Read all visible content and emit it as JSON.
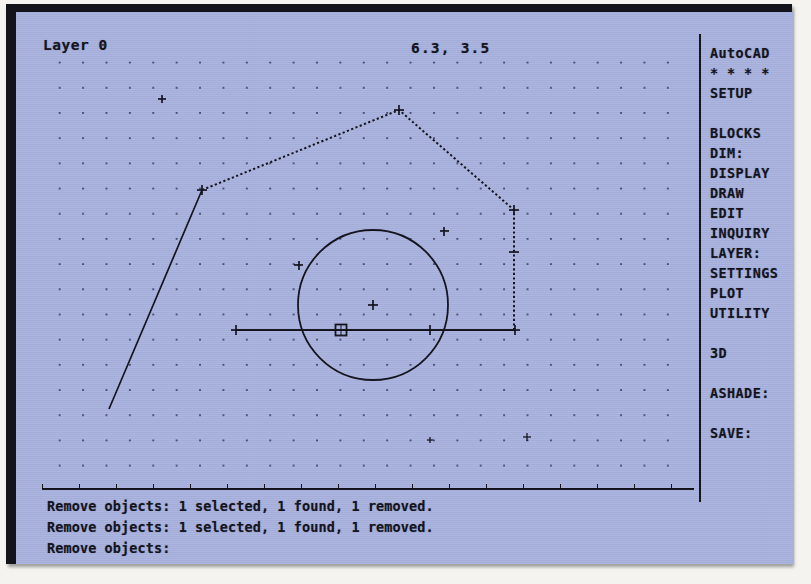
{
  "app": {
    "name": "AutoCAD",
    "screen_bg": "#a8b2df",
    "ink": "#10101a"
  },
  "status_bar": {
    "layer_label": "Layer 0",
    "coordinates": "6.3, 3.5"
  },
  "side_menu": {
    "items": [
      {
        "label": "AutoCAD",
        "y": 11,
        "name": "autocad-root"
      },
      {
        "label": "* * * *",
        "y": 31,
        "name": "osnap-asterisks"
      },
      {
        "label": "SETUP",
        "y": 51,
        "name": "setup"
      },
      {
        "label": "BLOCKS",
        "y": 91,
        "name": "blocks"
      },
      {
        "label": "DIM:",
        "y": 111,
        "name": "dim"
      },
      {
        "label": "DISPLAY",
        "y": 131,
        "name": "display"
      },
      {
        "label": "DRAW",
        "y": 151,
        "name": "draw"
      },
      {
        "label": "EDIT",
        "y": 171,
        "name": "edit"
      },
      {
        "label": "INQUIRY",
        "y": 191,
        "name": "inquiry"
      },
      {
        "label": "LAYER:",
        "y": 211,
        "name": "layer"
      },
      {
        "label": "SETTINGS",
        "y": 231,
        "name": "settings"
      },
      {
        "label": "PLOT",
        "y": 251,
        "name": "plot"
      },
      {
        "label": "UTILITY",
        "y": 271,
        "name": "utility"
      },
      {
        "label": "3D",
        "y": 311,
        "name": "3d"
      },
      {
        "label": "ASHADE:",
        "y": 351,
        "name": "ashade"
      },
      {
        "label": "SAVE:",
        "y": 391,
        "name": "save"
      }
    ]
  },
  "command_area": {
    "lines": [
      {
        "text": "Remove objects: 1 selected, 1 found, 1 removed.",
        "y": 4
      },
      {
        "text": "Remove objects: 1 selected, 1 found, 1 removed.",
        "y": 25
      },
      {
        "text": "Remove objects:",
        "y": 46
      }
    ]
  },
  "drawing": {
    "circle": {
      "cx": 357,
      "cy": 293,
      "r": 75,
      "style": "solid"
    },
    "horizontal_line": {
      "x1": 220,
      "y1": 318,
      "x2": 499,
      "y2": 318,
      "style": "solid"
    },
    "left_wall": {
      "x1": 93,
      "y1": 397,
      "x2": 186,
      "y2": 178,
      "style": "solid"
    },
    "roof_left": {
      "x1": 186,
      "y1": 178,
      "x2": 383,
      "y2": 98,
      "style": "dashed-highlighted"
    },
    "roof_right": {
      "x1": 383,
      "y1": 98,
      "x2": 498,
      "y2": 198,
      "style": "dashed-highlighted"
    },
    "right_wall": {
      "x1": 498,
      "y1": 198,
      "x2": 498,
      "y2": 320,
      "style": "dashed-highlighted"
    },
    "pick_box": {
      "x": 325,
      "y": 318,
      "size": 11
    },
    "grip_markers": [
      {
        "x": 357,
        "y": 293,
        "name": "circle-center-marker"
      },
      {
        "x": 220,
        "y": 318,
        "name": "line-left-endpoint"
      },
      {
        "x": 499,
        "y": 318,
        "name": "line-right-endpoint"
      },
      {
        "x": 383,
        "y": 318,
        "name": "line-mid-tick"
      },
      {
        "x": 282,
        "y": 253,
        "name": "circle-pick-mark-left"
      },
      {
        "x": 428,
        "y": 219,
        "name": "circle-pick-mark-upper-right"
      },
      {
        "x": 186,
        "y": 178,
        "name": "wall-roof-vertex"
      },
      {
        "x": 383,
        "y": 98,
        "name": "roof-apex"
      },
      {
        "x": 498,
        "y": 198,
        "name": "roof-right-vertex"
      },
      {
        "x": 498,
        "y": 240,
        "name": "right-wall-tick"
      },
      {
        "x": 146,
        "y": 87,
        "name": "stray-marker-upper-left"
      },
      {
        "x": 414,
        "y": 428,
        "name": "stray-marker-lower"
      },
      {
        "x": 511,
        "y": 425,
        "name": "stray-marker-lower-right"
      }
    ]
  }
}
